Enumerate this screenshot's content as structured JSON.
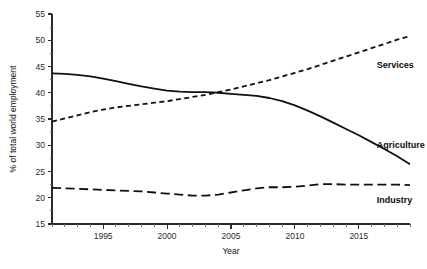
{
  "chart_data": {
    "type": "line",
    "title": "",
    "subtitle": "",
    "xlabel": "Year",
    "ylabel": "% of total world employment",
    "xlim": [
      1991,
      2019
    ],
    "ylim": [
      15,
      55
    ],
    "y_ticks": [
      15,
      20,
      25,
      30,
      35,
      40,
      45,
      50,
      55
    ],
    "x_ticks_major": [
      1995,
      2000,
      2005,
      2010,
      2015
    ],
    "x_tick_minor_step": 1,
    "grid": false,
    "legend_position": "inline-right",
    "x": [
      1991,
      1992,
      1993,
      1994,
      1995,
      1996,
      1997,
      1998,
      1999,
      2000,
      2001,
      2002,
      2003,
      2004,
      2005,
      2006,
      2007,
      2008,
      2009,
      2010,
      2011,
      2012,
      2013,
      2014,
      2015,
      2016,
      2017,
      2018,
      2019
    ],
    "series": [
      {
        "name": "Agriculture",
        "style": "solid",
        "label_x": 2016.4,
        "label_y": 30.0,
        "values": [
          43.7,
          43.6,
          43.4,
          43.1,
          42.7,
          42.2,
          41.7,
          41.2,
          40.8,
          40.4,
          40.2,
          40.1,
          40.1,
          40.0,
          39.8,
          39.6,
          39.4,
          39.0,
          38.4,
          37.6,
          36.6,
          35.5,
          34.3,
          33.1,
          31.9,
          30.6,
          29.3,
          27.9,
          26.4
        ]
      },
      {
        "name": "Services",
        "style": "dashed-short",
        "label_x": 2016.4,
        "label_y": 45.2,
        "values": [
          34.5,
          35.1,
          35.7,
          36.3,
          36.8,
          37.2,
          37.5,
          37.8,
          38.1,
          38.4,
          38.8,
          39.2,
          39.6,
          40.1,
          40.6,
          41.2,
          41.8,
          42.4,
          43.1,
          43.8,
          44.5,
          45.3,
          46.1,
          46.9,
          47.7,
          48.5,
          49.3,
          50.1,
          50.8
        ]
      },
      {
        "name": "Industry",
        "style": "dashed-long",
        "label_x": 2016.4,
        "label_y": 19.6,
        "values": [
          21.9,
          21.8,
          21.7,
          21.6,
          21.5,
          21.4,
          21.3,
          21.2,
          21.0,
          20.8,
          20.6,
          20.4,
          20.4,
          20.6,
          21.0,
          21.4,
          21.8,
          22.0,
          22.0,
          22.1,
          22.3,
          22.6,
          22.6,
          22.5,
          22.5,
          22.5,
          22.5,
          22.5,
          22.4
        ]
      }
    ]
  },
  "axis": {
    "y_title": "% of total world employment",
    "x_title": "Year",
    "y_tick_labels": [
      "15",
      "20",
      "25",
      "30",
      "35",
      "40",
      "45",
      "50",
      "55"
    ],
    "x_tick_labels": [
      "1995",
      "2000",
      "2005",
      "2010",
      "2015"
    ]
  },
  "series_labels": {
    "services": "Services",
    "agriculture": "Agriculture",
    "industry": "Industry"
  },
  "colors": {
    "ink": "#111111",
    "axis": "#2b2b2b",
    "background": "#ffffff"
  }
}
